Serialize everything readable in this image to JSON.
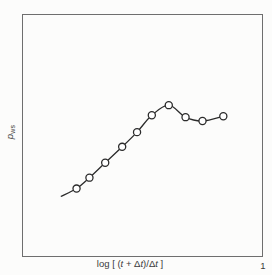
{
  "figure": {
    "background": "#fcfcfb",
    "frame_color": "#6e6e6e",
    "x_tick_label": "1",
    "xlabel_parts": [
      {
        "text": "log [ ("
      },
      {
        "text": "t",
        "italic": true
      },
      {
        "text": " + Δ"
      },
      {
        "text": "t",
        "italic": true
      },
      {
        "text": ")/Δ"
      },
      {
        "text": "t",
        "italic": true
      },
      {
        "text": " ]"
      }
    ],
    "ylabel_parts": [
      {
        "text": "p",
        "italic": true
      },
      {
        "text": "ws",
        "sub": true
      }
    ]
  },
  "chart_data": {
    "type": "line",
    "title": "",
    "xlabel": "log [ (t + Δt)/Δt ]",
    "ylabel": "p_ws",
    "x_tick_labels": [
      {
        "label": "1",
        "position": "right end of x-axis"
      }
    ],
    "y_tick_labels": [],
    "grid": false,
    "legend": null,
    "axes_note": "schematic Horner pressure-buildup plot; axes carry no numeric scale except the '1' at the right end of the x-axis",
    "line_color": "#2b2b2b",
    "line_width": 1.3,
    "marker": {
      "shape": "open-circle",
      "fill": "#ffffff",
      "stroke": "#2b2b2b",
      "radius": 3.6,
      "stroke_width": 1.3
    },
    "line_tail_start": [
      0.158,
      0.247
    ],
    "points": [
      [
        0.224,
        0.28
      ],
      [
        0.278,
        0.325
      ],
      [
        0.344,
        0.387
      ],
      [
        0.415,
        0.453
      ],
      [
        0.477,
        0.514
      ],
      [
        0.539,
        0.584
      ],
      [
        0.61,
        0.626
      ],
      [
        0.68,
        0.576
      ],
      [
        0.751,
        0.56
      ],
      [
        0.838,
        0.58
      ]
    ],
    "coords_note": "points are [x,y] fractions of the plot area measured from its bottom-left corner"
  }
}
